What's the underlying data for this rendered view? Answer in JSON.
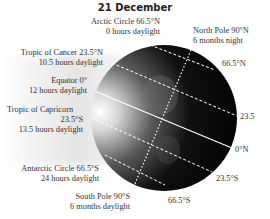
{
  "title": "21 December",
  "labels": {
    "arctic": {
      "line1": "Arctic Circle 66.5°N",
      "line2": "0 hours daylight"
    },
    "north_pole": {
      "line1": "North Pole 90°N",
      "line2": "6 months night"
    },
    "cancer": {
      "line1": "Tropic of Cancer 23.5°N",
      "line2": "10.5 hours daylight"
    },
    "equator": {
      "line1": "Equator 0°",
      "line2": "12 hours daylight"
    },
    "capricorn": {
      "line1": "Tropic of Capricorn",
      "line2": "23.5°S",
      "line3": "13.5 hours daylight"
    },
    "antarctic": {
      "line1": "Antarctic Circle 66.5°S",
      "line2": "24 hours daylight"
    },
    "south_pole": {
      "line1": "South Pole 90°S",
      "line2": "6 months daylight"
    }
  },
  "right_labels": {
    "n665": "66.5°N",
    "n235": "23.5",
    "eq": "0°N",
    "s235": "23.5°S",
    "s665": "66.5°S"
  },
  "colors": {
    "globe_dark": "#050505",
    "globe_lit": "#f4f4f4",
    "lines": "#ffffff"
  }
}
